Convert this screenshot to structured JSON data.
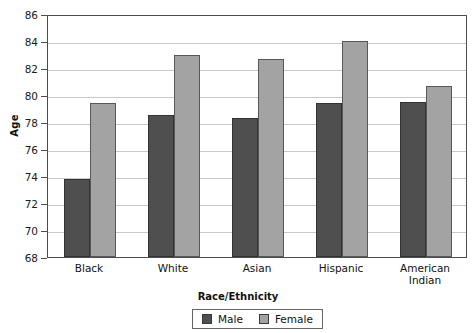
{
  "chart_data": {
    "type": "bar",
    "title": "",
    "xlabel": "Race/Ethnicity",
    "ylabel": "Age",
    "ylim": [
      68,
      86
    ],
    "ytick_step": 2,
    "yticks": [
      68,
      70,
      72,
      74,
      76,
      78,
      80,
      82,
      84,
      86
    ],
    "grid": true,
    "legend_position": "bottom-center",
    "categories": [
      "Black",
      "White",
      "Asian",
      "Hispanic",
      "American Indian"
    ],
    "series": [
      {
        "name": "Male",
        "color": "#4f4f4f",
        "values": [
          73.8,
          78.5,
          78.3,
          79.4,
          79.5
        ]
      },
      {
        "name": "Female",
        "color": "#a3a3a3",
        "values": [
          79.4,
          83.0,
          82.7,
          84.0,
          80.7
        ]
      }
    ]
  },
  "axes": {
    "y_title": "Age",
    "x_title": "Race/Ethnicity",
    "y_tick_labels": [
      "86",
      "84",
      "82",
      "80",
      "78",
      "76",
      "74",
      "72",
      "70",
      "68"
    ],
    "x_tick_labels": [
      "Black",
      "White",
      "Asian",
      "American",
      "Indian",
      "Hispanic"
    ]
  },
  "x_groups": [
    {
      "line1": "Black",
      "line2": ""
    },
    {
      "line1": "White",
      "line2": ""
    },
    {
      "line1": "Asian",
      "line2": ""
    },
    {
      "line1": "Hispanic",
      "line2": ""
    },
    {
      "line1": "American",
      "line2": "Indian"
    }
  ],
  "legend": {
    "items": [
      {
        "label": "Male",
        "color": "#4f4f4f"
      },
      {
        "label": "Female",
        "color": "#a3a3a3"
      }
    ]
  }
}
